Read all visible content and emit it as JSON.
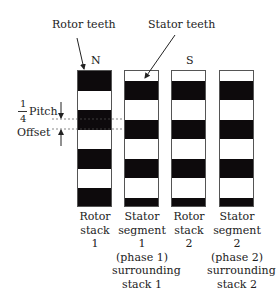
{
  "labels": {
    "rotor_teeth": "Rotor teeth",
    "stator_teeth": "Stator teeth",
    "pole_n": "N",
    "pole_s": "S",
    "fraction_num": "1",
    "fraction_den": "4",
    "pitch": "Pitch",
    "offset": "Offset"
  },
  "columns": [
    {
      "id": "rotor-stack-1",
      "caption": [
        "Rotor",
        "stack",
        "1"
      ]
    },
    {
      "id": "stator-segment-1",
      "caption": [
        "Stator",
        "segment",
        "1",
        "(phase 1)",
        "surrounding",
        "stack 1"
      ]
    },
    {
      "id": "rotor-stack-2",
      "caption": [
        "Rotor",
        "stack",
        "2"
      ]
    },
    {
      "id": "stator-segment-2",
      "caption": [
        "Stator",
        "segment",
        "2",
        "(phase 2)",
        "surrounding",
        "stack 2"
      ]
    }
  ],
  "colors": {
    "tooth": "#0d0a0c",
    "outline": "#555555",
    "background": "#ffffff"
  }
}
